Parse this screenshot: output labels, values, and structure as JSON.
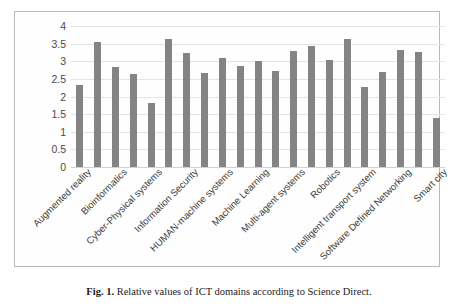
{
  "figure": {
    "caption_label": "Fig. 1.",
    "caption_text": "Relative values of ICT domains according to Science Direct."
  },
  "chart_data": {
    "type": "bar",
    "title": "",
    "xlabel": "",
    "ylabel": "",
    "ylim": [
      0,
      4
    ],
    "yticks": [
      "0",
      "0.5",
      "1",
      "1.5",
      "2",
      "2.5",
      "3",
      "3.5",
      "4"
    ],
    "grid": true,
    "legend": "none",
    "bar_color": "#848484",
    "grid_color": "#e4e4e4",
    "categories": [
      "Augmented reality",
      "",
      "Bioinformatics",
      "",
      "Cyber-Physical systems",
      "",
      "Information Security",
      "",
      "HUMAN-machine systems",
      "",
      "Machine Learning",
      "",
      "Multi-agent systems",
      "",
      "Robotics",
      "",
      "Intelligent transport system",
      "",
      "Software Defined Networking",
      "",
      "Smart city"
    ],
    "tick_labels": [
      "Augmented reality",
      "Bioinformatics",
      "Cyber-Physical systems",
      "Information Security",
      "HUMAN-machine systems",
      "Machine Learning",
      "Multi-agent systems",
      "Robotics",
      "Intelligent transport system",
      "Software Defined Networking",
      "Smart city"
    ],
    "values": [
      2.32,
      3.56,
      2.85,
      2.64,
      1.81,
      3.62,
      3.23,
      2.68,
      3.08,
      2.86,
      3.02,
      2.71,
      3.28,
      3.42,
      3.05,
      3.63,
      2.27,
      2.7,
      3.32,
      3.27,
      1.38
    ]
  }
}
